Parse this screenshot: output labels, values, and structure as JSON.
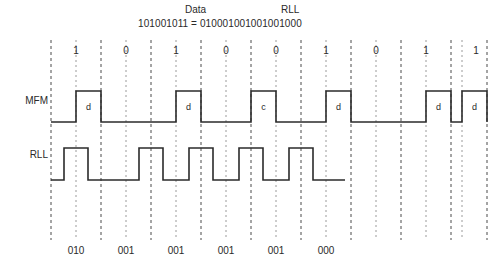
{
  "header": {
    "data_title": "Data",
    "rll_title": "RLL",
    "equation": "101001011 = 010001001001001000"
  },
  "axis": {
    "bit_labels": [
      "1",
      "0",
      "1",
      "0",
      "0",
      "1",
      "0",
      "1",
      "1"
    ],
    "code_labels": [
      "010",
      "001",
      "001",
      "001",
      "001",
      "000"
    ]
  },
  "rows": [
    {
      "name": "MFM",
      "label": "MFM"
    },
    {
      "name": "RLL",
      "label": "RLL"
    }
  ],
  "mfm": {
    "pulse_labels": [
      "d",
      "d",
      "c",
      "d",
      "d",
      "d"
    ],
    "baseline_y": 122,
    "top_y": 91,
    "start_x": 51,
    "end_x": 487,
    "pulses": [
      {
        "start_x": 76,
        "end_x": 101,
        "label": "d"
      },
      {
        "start_x": 176,
        "end_x": 201,
        "label": "d"
      },
      {
        "start_x": 251,
        "end_x": 276,
        "label": "c"
      },
      {
        "start_x": 326,
        "end_x": 351,
        "label": "d"
      },
      {
        "start_x": 426,
        "end_x": 451,
        "label": "d"
      },
      {
        "start_x": 462,
        "end_x": 487,
        "label": "d"
      }
    ]
  },
  "rll": {
    "baseline_y": 180,
    "top_y": 148,
    "start_x": 51,
    "end_x": 345,
    "pulses": [
      {
        "start_x": 64,
        "end_x": 88
      },
      {
        "start_x": 139,
        "end_x": 163
      },
      {
        "start_x": 189,
        "end_x": 213
      },
      {
        "start_x": 239,
        "end_x": 263
      },
      {
        "start_x": 289,
        "end_x": 313
      }
    ]
  },
  "grid": {
    "major_x": [
      51,
      101,
      151,
      201,
      251,
      301,
      351,
      401,
      451,
      487
    ],
    "minor_x": [
      76,
      126,
      176,
      226,
      276,
      326,
      376,
      426,
      462
    ],
    "top_y": 40,
    "bottom_y": 240,
    "major_color": "#4a4a4a",
    "minor_color": "#9a9a9a"
  },
  "colors": {
    "trace": "#2b2b2b",
    "text": "#2a2a2a",
    "background": "#ffffff"
  }
}
